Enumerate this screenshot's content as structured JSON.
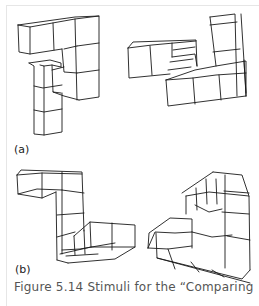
{
  "figure": {
    "panels": [
      {
        "label": "(a)",
        "description": "Pair of 3D cube-arrangement stimuli"
      },
      {
        "label": "(b)",
        "description": "Pair of 3D cube-arrangement stimuli"
      }
    ],
    "caption": "Figure 5.14  Stimuli for the “Comparing"
  }
}
